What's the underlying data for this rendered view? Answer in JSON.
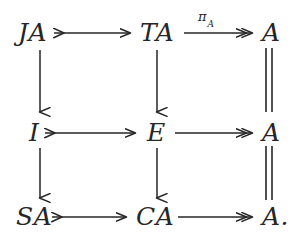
{
  "figure": {
    "kind": "commutative-diagram",
    "background_color": "#ffffff",
    "ink_color": "#262626"
  },
  "nodes": [
    {
      "id": "n00",
      "label": "JA",
      "row": 0,
      "col": 0,
      "x": 18,
      "y": 26
    },
    {
      "id": "n01",
      "label": "TA",
      "row": 0,
      "col": 1,
      "x": 140,
      "y": 26
    },
    {
      "id": "n02",
      "label": "A",
      "row": 0,
      "col": 2,
      "x": 262,
      "y": 26
    },
    {
      "id": "n10",
      "label": "I",
      "row": 1,
      "col": 0,
      "x": 29,
      "y": 126
    },
    {
      "id": "n11",
      "label": "E",
      "row": 1,
      "col": 1,
      "x": 147,
      "y": 126
    },
    {
      "id": "n12",
      "label": "A",
      "row": 1,
      "col": 2,
      "x": 262,
      "y": 126
    },
    {
      "id": "n20",
      "label": "SA",
      "row": 2,
      "col": 0,
      "x": 16,
      "y": 210
    },
    {
      "id": "n21",
      "label": "CA",
      "row": 2,
      "col": 1,
      "x": 136,
      "y": 210
    },
    {
      "id": "n22",
      "label": "A.",
      "row": 2,
      "col": 2,
      "x": 262,
      "y": 210
    }
  ],
  "arrows": [
    {
      "id": "a-top-left",
      "from": "JA",
      "to": "TA",
      "style": "mono",
      "direction": "right",
      "label": ""
    },
    {
      "id": "a-top-right",
      "from": "TA",
      "to": "A",
      "style": "epi",
      "direction": "right",
      "label": "piA"
    },
    {
      "id": "a-mid-left",
      "from": "I",
      "to": "E",
      "style": "mono",
      "direction": "right",
      "label": ""
    },
    {
      "id": "a-mid-right",
      "from": "E",
      "to": "A",
      "style": "epi",
      "direction": "right",
      "label": ""
    },
    {
      "id": "a-bot-left",
      "from": "SA",
      "to": "CA",
      "style": "mono",
      "direction": "right",
      "label": ""
    },
    {
      "id": "a-bot-right",
      "from": "CA",
      "to": "A",
      "style": "epi",
      "direction": "right",
      "label": ""
    },
    {
      "id": "a-col0-top",
      "from": "JA",
      "to": "I",
      "style": "plain",
      "direction": "down",
      "label": ""
    },
    {
      "id": "a-col0-bot",
      "from": "I",
      "to": "SA",
      "style": "plain",
      "direction": "down",
      "label": ""
    },
    {
      "id": "a-col1-top",
      "from": "TA",
      "to": "E",
      "style": "plain",
      "direction": "down",
      "label": ""
    },
    {
      "id": "a-col1-bot",
      "from": "E",
      "to": "CA",
      "style": "plain",
      "direction": "down",
      "label": ""
    },
    {
      "id": "a-col2-top",
      "from": "A",
      "to": "A",
      "style": "equality",
      "direction": "down",
      "label": ""
    },
    {
      "id": "a-col2-bot",
      "from": "A",
      "to": "A",
      "style": "equality",
      "direction": "down",
      "label": ""
    }
  ],
  "labels": {
    "pi_a_symbol": "π",
    "pi_a_subscript": "A"
  }
}
